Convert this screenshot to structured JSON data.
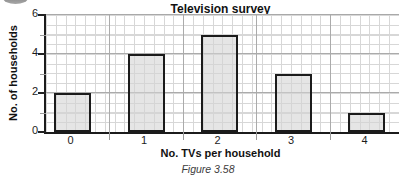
{
  "decoration": {
    "icon": "partial-circle-badge"
  },
  "caption": "Figure 3.58",
  "chart_data": {
    "type": "bar",
    "title": "Television survey",
    "xlabel": "No. TVs per household",
    "ylabel": "No. of households",
    "categories": [
      "0",
      "1",
      "2",
      "3",
      "4"
    ],
    "values": [
      2,
      4,
      5,
      3,
      1
    ],
    "ylim": [
      0,
      6
    ],
    "yticks": [
      0,
      2,
      4,
      6
    ],
    "grid": true,
    "legend": "none",
    "colors": {
      "bar_fill": "#e2e2e2",
      "bar_border": "#1b1b1b",
      "axis": "#1b1b1b",
      "grid_minor": "#d7d7d7",
      "grid_major": "#ababab",
      "caption_text": "#3d3d3d"
    }
  }
}
